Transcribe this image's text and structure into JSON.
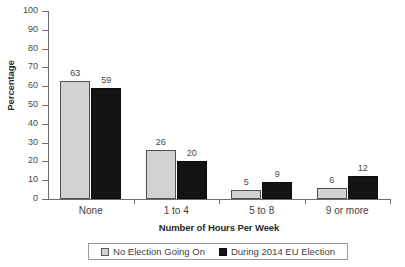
{
  "chart_data": {
    "type": "bar",
    "title": "",
    "subtitle": "",
    "xlabel": "Number of Hours Per Week",
    "ylabel": "Percentage",
    "categories": [
      "None",
      "1 to 4",
      "5 to 8",
      "9 or more"
    ],
    "series": [
      {
        "name": "No Election Going On",
        "color": "#d2d2d2",
        "values": [
          63,
          26,
          5,
          6
        ]
      },
      {
        "name": "During 2014 EU Election",
        "color": "#141414",
        "values": [
          59,
          20,
          9,
          12
        ]
      }
    ],
    "ylim": [
      0,
      100
    ],
    "ytick_step": 10,
    "yticks": [
      100,
      90,
      80,
      70,
      60,
      50,
      40,
      30,
      20,
      10,
      0
    ],
    "grid": false,
    "legend_position": "bottom",
    "value_labels": true,
    "axis_color": "#6d6d6d",
    "text_color": "#3f3f3f"
  },
  "legend": {
    "items": [
      {
        "label": "No Election Going On",
        "swatch": "light"
      },
      {
        "label": "During 2014 EU Election",
        "swatch": "dark"
      }
    ]
  }
}
